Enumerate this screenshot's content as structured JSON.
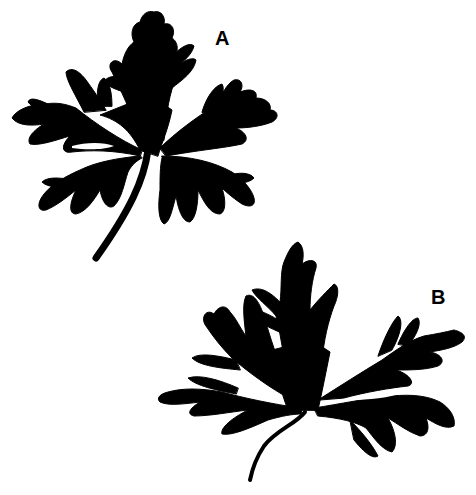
{
  "figure": {
    "background_color": "#ffffff",
    "silhouette_color": "#000000",
    "panels": [
      {
        "id": "A",
        "label": "A",
        "description": "leaf silhouette with long straight stem, palmately lobed"
      },
      {
        "id": "B",
        "label": "B",
        "description": "leaf silhouette with short curved stem, broader spreading lobes"
      }
    ]
  }
}
